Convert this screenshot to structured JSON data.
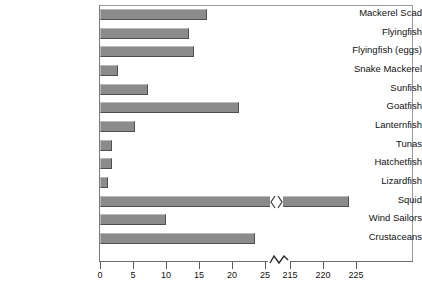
{
  "chart_data": {
    "type": "bar",
    "orientation": "horizontal",
    "title": "",
    "xlabel": "",
    "ylabel": "",
    "grid": false,
    "legend": null,
    "axis_break": {
      "from": 25,
      "to": 215,
      "note": "x-axis broken between 25 and 215"
    },
    "xticks": [
      0,
      5,
      10,
      15,
      20,
      25,
      215,
      220,
      225
    ],
    "xtick_labels": [
      "0",
      "5",
      "10",
      "15",
      "20",
      "25",
      "215",
      "220",
      "225"
    ],
    "categories": [
      "Mackerel Scad",
      "Flyingfish",
      "Flyingfish (eggs)",
      "Snake Mackerel",
      "Sunfish",
      "Goatfish",
      "Lanternfish",
      "Tunas",
      "Hatchetfish",
      "Lizardfish",
      "Squid",
      "Wind Sailors",
      "Crustaceans"
    ],
    "values": [
      16.2,
      13.5,
      14.3,
      2.7,
      7.3,
      21.0,
      5.3,
      1.8,
      1.8,
      1.2,
      224.0,
      10.0,
      23.5
    ],
    "broken_bar_index": 10,
    "xlim_left": [
      0,
      25
    ],
    "xlim_right": [
      215,
      227
    ]
  },
  "style": {
    "bar_fill": "#8b8b8b",
    "bar_highlight": "#b9b9b9",
    "bar_lowlight": "#4f4f4f",
    "shadow": "#bdbdbd",
    "frame": "#9a9a9a",
    "text": "#111111"
  }
}
